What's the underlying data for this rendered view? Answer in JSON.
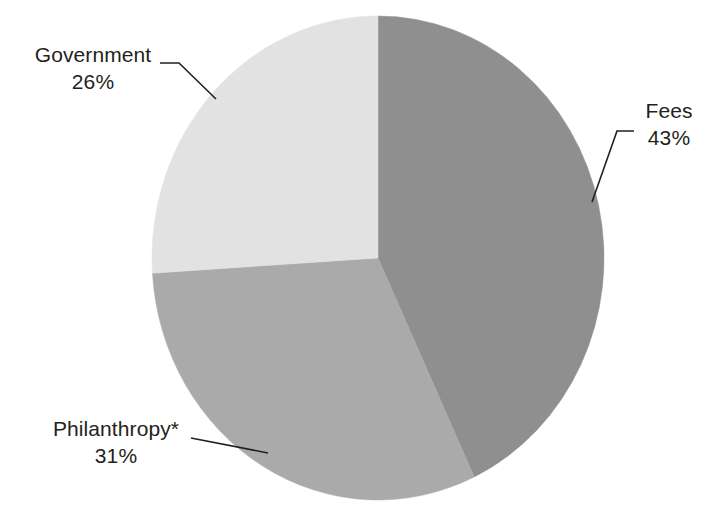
{
  "chart_data": {
    "type": "pie",
    "title": "",
    "subtitle": "",
    "xlabel": "",
    "ylabel": "",
    "legend_position": "none",
    "grid": false,
    "labels_style": "outside-with-leader-lines",
    "start_angle_deg": 0,
    "direction": "clockwise",
    "total": 100,
    "units": "%",
    "categories": [
      "Fees",
      "Philanthropy*",
      "Government"
    ],
    "values": [
      43,
      31,
      26
    ],
    "slices": [
      {
        "name": "Fees",
        "label": "Fees",
        "value": 43,
        "value_label": "43%",
        "color": "#8f8f8f",
        "start_angle_deg": 0,
        "end_angle_deg": 154.8,
        "label_position": "right"
      },
      {
        "name": "Philanthropy",
        "label": "Philanthropy*",
        "value": 31,
        "value_label": "31%",
        "color": "#aaaaaa",
        "start_angle_deg": 154.8,
        "end_angle_deg": 266.4,
        "label_position": "bottom-left"
      },
      {
        "name": "Government",
        "label": "Government",
        "value": 26,
        "value_label": "26%",
        "color": "#e2e2e2",
        "start_angle_deg": 266.4,
        "end_angle_deg": 360,
        "label_position": "top-left"
      }
    ],
    "footnote_marker": "*",
    "background_color": "#ffffff",
    "text_color": "#231f20",
    "leader_line_color": "#231f20"
  },
  "labels": {
    "government": {
      "name": "Government",
      "value": "26%"
    },
    "fees": {
      "name": "Fees",
      "value": "43%"
    },
    "philanthropy": {
      "name": "Philanthropy*",
      "value": "31%"
    }
  },
  "alt": "Pie chart showing Fees 43 percent, Philanthropy 31 percent, Government 26 percent"
}
